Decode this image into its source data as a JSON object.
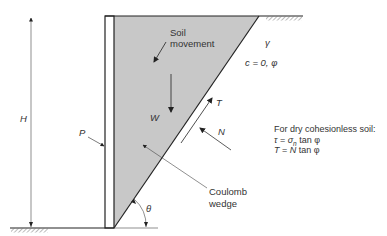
{
  "diagram": {
    "labels": {
      "height": "H",
      "wall_force": "P",
      "soil_movement_line1": "Soil",
      "soil_movement_line2": "movement",
      "weight": "W",
      "shear_force": "T",
      "normal_force": "N",
      "unit_weight": "γ",
      "strength_params": "c = 0, φ",
      "wedge_line1": "Coulomb",
      "wedge_line2": "wedge",
      "angle": "θ"
    },
    "note": {
      "heading": "For dry cohesionless soil:",
      "eq1": "τ = σn tan φ",
      "eq1_parts": {
        "tau": "τ",
        "eq": " = ",
        "sigma": "σ",
        "sub": "n",
        "rest": " tan φ"
      },
      "eq2_parts": {
        "T": "T",
        "eq": " = ",
        "N": "N",
        "rest": " tan φ"
      }
    },
    "colors": {
      "wedge_fill": "#c8c8c8",
      "line": "#222222",
      "background": "#ffffff"
    }
  }
}
